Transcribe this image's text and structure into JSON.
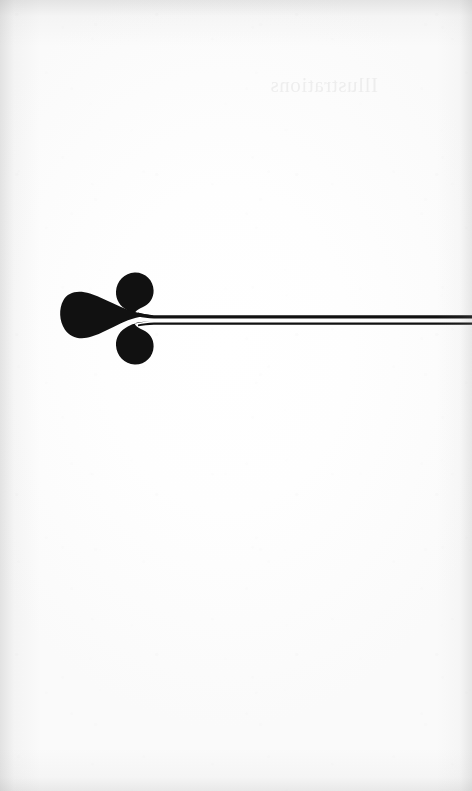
{
  "page": {
    "kind": "scanned-book-page",
    "width": 472,
    "height": 791,
    "paper_color": "#fdfdfd",
    "ink_color": "#111111",
    "orientation": "portrait",
    "visible_text": ""
  },
  "showthrough": {
    "description": "faint illegible bleed-through from reverse of leaf",
    "text": "Illustrations",
    "color": "#787878",
    "left": 262,
    "top": 70
  },
  "ornament": {
    "name": "fleuron-rule",
    "description": "printer's ornament: three-lobed aldus leaf whose tails converge into a horizontal double rule running to the right page edge",
    "ink_color": "#111111",
    "lobe_count": 3,
    "center_lobe": {
      "cx": 88,
      "cy": 56,
      "rx": 27,
      "ry": 25
    },
    "upper_lobe": {
      "cx": 118,
      "cy": 28,
      "rx": 19,
      "ry": 18
    },
    "lower_lobe": {
      "cx": 118,
      "cy": 84,
      "rx": 19,
      "ry": 18
    },
    "junction_x": 150,
    "rule": {
      "start_x": 150,
      "end_x": 472,
      "top_line_y": 54,
      "top_line_thickness": 3,
      "gap_thickness": 2,
      "bottom_line_y": 59,
      "bottom_line_thickness": 2
    }
  }
}
